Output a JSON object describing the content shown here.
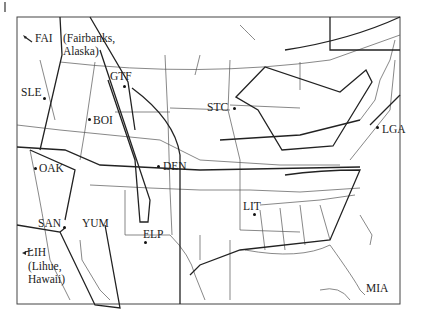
{
  "map": {
    "title": "U.S. airport regions map",
    "airports": [
      {
        "code": "FAI",
        "note_line1": "(Fairbanks,",
        "note_line2": "Alaska)"
      },
      {
        "code": "SLE"
      },
      {
        "code": "BOI"
      },
      {
        "code": "GTF"
      },
      {
        "code": "STC"
      },
      {
        "code": "LGA"
      },
      {
        "code": "OAK"
      },
      {
        "code": "DEN"
      },
      {
        "code": "SAN"
      },
      {
        "code": "YUM"
      },
      {
        "code": "ELP"
      },
      {
        "code": "LIT"
      },
      {
        "code": "LIH",
        "note_line1": "(Lihue,",
        "note_line2": "Hawaii)"
      },
      {
        "code": "MIA"
      }
    ],
    "colors": {
      "line": "#222222",
      "border": "#555555",
      "background": "#ffffff"
    }
  }
}
